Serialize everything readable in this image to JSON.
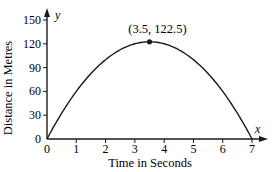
{
  "chart_data": {
    "type": "line",
    "title": "",
    "xlabel": "Time in Seconds",
    "ylabel": "Distance in Metres",
    "x_axis_symbol": "x",
    "y_axis_symbol": "y",
    "xlim": [
      0,
      7
    ],
    "ylim": [
      0,
      150
    ],
    "x_ticks": [
      "0",
      "1",
      "2",
      "3",
      "4",
      "5",
      "6",
      "7"
    ],
    "y_ticks": [
      "0",
      "30",
      "60",
      "90",
      "120",
      "150"
    ],
    "grid": false,
    "legend": null,
    "series": [
      {
        "name": "distance",
        "equation": "y = -10x^2 + 70x",
        "x": [
          0,
          0.5,
          1,
          1.5,
          2,
          2.5,
          3,
          3.5,
          4,
          4.5,
          5,
          5.5,
          6,
          6.5,
          7
        ],
        "values": [
          0,
          32.5,
          60,
          82.5,
          100,
          112.5,
          120,
          122.5,
          120,
          112.5,
          100,
          82.5,
          60,
          32.5,
          0
        ]
      }
    ],
    "annotations": [
      {
        "text": "(3.5, 122.5)",
        "x": 3.5,
        "y": 122.5,
        "marker": "point"
      }
    ]
  }
}
